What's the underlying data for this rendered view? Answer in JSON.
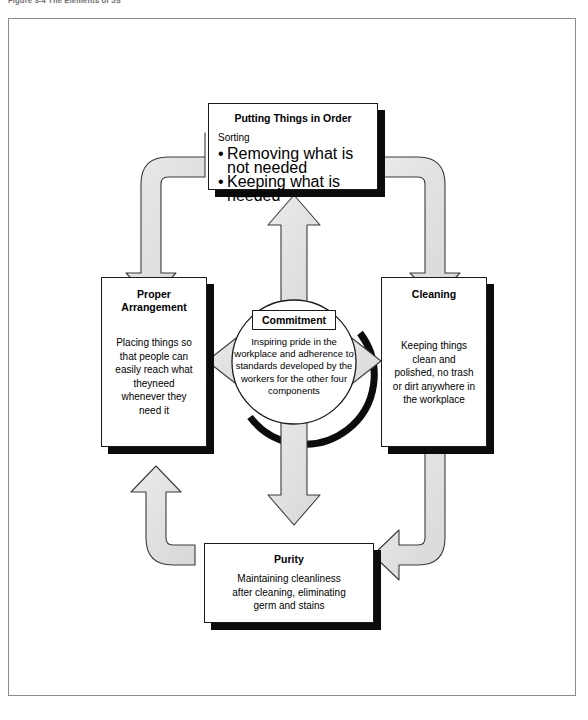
{
  "figure": {
    "caption": "Figure 3-4  The Elements of 5S"
  },
  "center": {
    "badge_label": "Commitment",
    "description": "Inspiring pride in the workplace and adherence to standards developed by the workers for the other four components"
  },
  "nodes": {
    "top": {
      "title": "Putting Things in Order",
      "intro": "Sorting",
      "bullets": [
        "Removing what is not needed",
        "Keeping what is needed"
      ]
    },
    "right": {
      "title": "Cleaning",
      "body": "Keeping things clean and polished, no trash or dirt anywhere in the workplace"
    },
    "bottom": {
      "title": "Purity",
      "body": "Maintaining cleanliness after cleaning, eliminating germ and stains"
    },
    "left": {
      "title_line1": "Proper",
      "title_line2": "Arrangement",
      "body": "Placing things so that people can easily reach what theyneed whenever they need it"
    }
  },
  "flow": {
    "cycle": [
      "Putting Things in Order",
      "Cleaning",
      "Purity",
      "Proper Arrangement"
    ],
    "radial": [
      "Commitment -> Putting Things in Order",
      "Commitment -> Cleaning",
      "Commitment -> Purity",
      "Commitment -> Proper Arrangement"
    ]
  },
  "colors": {
    "arrow_fill": "#e2e2e2",
    "arrow_stroke": "#3b3b3b",
    "box_stroke": "#1b1b1b",
    "box_shadow": "#0b0b0b",
    "frame_stroke": "#8b8b8b",
    "page_background": "#ffffff"
  }
}
